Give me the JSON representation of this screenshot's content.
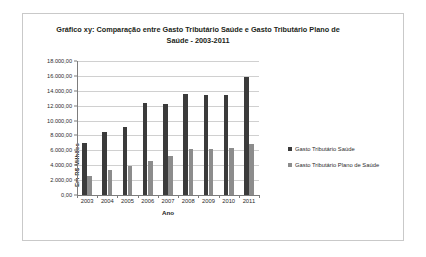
{
  "chart_data": {
    "type": "bar",
    "title": "Gráfico xy: Comparação entre Gasto Tributário Saúde e Gasto Tributário Plano de Saúde - 2003-2011",
    "title_line1": "Gráfico xy: Comparação entre Gasto Tributário Saúde e Gasto Tributário Plano",
    "title_line2": "de Saúde - 2003-2011",
    "xlabel": "Ano",
    "ylabel": "Em R$ Milhões",
    "categories": [
      "2003",
      "2004",
      "2005",
      "2006",
      "2007",
      "2008",
      "2009",
      "2010",
      "2011"
    ],
    "ylim": [
      0,
      18000
    ],
    "ytick_step": 2000,
    "ytick_labels": [
      "18.000,00",
      "16.000,00",
      "14.000,00",
      "12.000,00",
      "10.000,00",
      "8.000,00",
      "6.000,00",
      "4.000,00",
      "2.000,00",
      "0,00"
    ],
    "grid": true,
    "legend_position": "right",
    "series": [
      {
        "name": "Gasto Tributário Saúde",
        "color": "#3b3b3b",
        "values": [
          7000,
          8500,
          9200,
          12400,
          12200,
          13600,
          13500,
          13400,
          15800
        ]
      },
      {
        "name": "Gasto Tributário Plano de Saúde",
        "color": "#8c8c8c",
        "values": [
          2600,
          3300,
          3900,
          4600,
          5300,
          6200,
          6200,
          6300,
          6900
        ]
      }
    ]
  },
  "legend": {
    "items": [
      {
        "label": "Gasto Tributário Saúde",
        "color": "#3b3b3b"
      },
      {
        "label": "Gasto Tributário Plano de Saúde",
        "color": "#8c8c8c"
      }
    ]
  }
}
